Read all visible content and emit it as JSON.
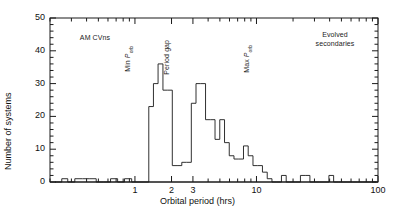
{
  "chart_data": {
    "type": "bar",
    "title": "",
    "subtitle": "",
    "xlabel": "Orbital period (hrs)",
    "ylabel": "Number of systems",
    "xscale": "log",
    "yscale": "linear",
    "xlim": [
      0.2,
      100
    ],
    "ylim": [
      0,
      50
    ],
    "grid": false,
    "legend_position": "none",
    "xticks": [
      1,
      2,
      3,
      10,
      100
    ],
    "xtick_labels": [
      "1",
      "2",
      "3",
      "10",
      "100"
    ],
    "yticks": [
      0,
      10,
      20,
      30,
      40,
      50
    ],
    "ytick_labels": [
      "0",
      "10",
      "20",
      "30",
      "40",
      "50"
    ],
    "bin_edges_log_per_decade": 18,
    "bins": [
      {
        "lo": 0.22,
        "hi": 0.25,
        "value": 0
      },
      {
        "lo": 0.25,
        "hi": 0.28,
        "value": 1
      },
      {
        "lo": 0.28,
        "hi": 0.32,
        "value": 0
      },
      {
        "lo": 0.32,
        "hi": 0.37,
        "value": 1
      },
      {
        "lo": 0.37,
        "hi": 0.42,
        "value": 1
      },
      {
        "lo": 0.42,
        "hi": 0.48,
        "value": 1
      },
      {
        "lo": 0.48,
        "hi": 0.55,
        "value": 0
      },
      {
        "lo": 0.55,
        "hi": 0.63,
        "value": 0
      },
      {
        "lo": 0.63,
        "hi": 0.72,
        "value": 1
      },
      {
        "lo": 0.72,
        "hi": 0.82,
        "value": 0
      },
      {
        "lo": 0.82,
        "hi": 0.94,
        "value": 1
      },
      {
        "lo": 0.94,
        "hi": 1.08,
        "value": 0
      },
      {
        "lo": 1.08,
        "hi": 1.23,
        "value": 0
      },
      {
        "lo": 1.23,
        "hi": 1.3,
        "value": 0
      },
      {
        "lo": 1.3,
        "hi": 1.42,
        "value": 23
      },
      {
        "lo": 1.42,
        "hi": 1.55,
        "value": 30
      },
      {
        "lo": 1.55,
        "hi": 1.7,
        "value": 36
      },
      {
        "lo": 1.7,
        "hi": 1.86,
        "value": 28
      },
      {
        "lo": 1.86,
        "hi": 2.03,
        "value": 28
      },
      {
        "lo": 2.03,
        "hi": 2.22,
        "value": 5
      },
      {
        "lo": 2.22,
        "hi": 2.43,
        "value": 5
      },
      {
        "lo": 2.43,
        "hi": 2.66,
        "value": 6
      },
      {
        "lo": 2.66,
        "hi": 2.91,
        "value": 6
      },
      {
        "lo": 2.91,
        "hi": 3.18,
        "value": 24
      },
      {
        "lo": 3.18,
        "hi": 3.48,
        "value": 30
      },
      {
        "lo": 3.48,
        "hi": 3.81,
        "value": 30
      },
      {
        "lo": 3.81,
        "hi": 4.17,
        "value": 19
      },
      {
        "lo": 4.17,
        "hi": 4.56,
        "value": 19
      },
      {
        "lo": 4.56,
        "hi": 4.99,
        "value": 13
      },
      {
        "lo": 4.99,
        "hi": 5.46,
        "value": 19
      },
      {
        "lo": 5.46,
        "hi": 5.97,
        "value": 12
      },
      {
        "lo": 5.97,
        "hi": 6.53,
        "value": 8
      },
      {
        "lo": 6.53,
        "hi": 7.15,
        "value": 7
      },
      {
        "lo": 7.15,
        "hi": 7.82,
        "value": 7
      },
      {
        "lo": 7.82,
        "hi": 8.55,
        "value": 11
      },
      {
        "lo": 8.55,
        "hi": 9.36,
        "value": 8
      },
      {
        "lo": 9.36,
        "hi": 10.24,
        "value": 5
      },
      {
        "lo": 10.24,
        "hi": 11.2,
        "value": 5
      },
      {
        "lo": 11.2,
        "hi": 12.26,
        "value": 3
      },
      {
        "lo": 12.26,
        "hi": 13.41,
        "value": 1
      },
      {
        "lo": 13.41,
        "hi": 14.67,
        "value": 0
      },
      {
        "lo": 14.67,
        "hi": 16.05,
        "value": 0
      },
      {
        "lo": 16.05,
        "hi": 17.56,
        "value": 2
      },
      {
        "lo": 17.56,
        "hi": 19.22,
        "value": 0
      },
      {
        "lo": 19.22,
        "hi": 21.03,
        "value": 0
      },
      {
        "lo": 21.03,
        "hi": 23.0,
        "value": 0
      },
      {
        "lo": 23.0,
        "hi": 25.16,
        "value": 2
      },
      {
        "lo": 25.16,
        "hi": 27.53,
        "value": 2
      },
      {
        "lo": 27.53,
        "hi": 30.12,
        "value": 0
      },
      {
        "lo": 30.12,
        "hi": 32.95,
        "value": 0
      },
      {
        "lo": 32.95,
        "hi": 36.05,
        "value": 0
      },
      {
        "lo": 36.05,
        "hi": 39.44,
        "value": 0
      },
      {
        "lo": 39.44,
        "hi": 43.15,
        "value": 2
      },
      {
        "lo": 43.15,
        "hi": 47.21,
        "value": 0
      },
      {
        "lo": 47.21,
        "hi": 51.65,
        "value": 0
      },
      {
        "lo": 51.65,
        "hi": 56.51,
        "value": 0
      },
      {
        "lo": 56.51,
        "hi": 61.82,
        "value": 0
      },
      {
        "lo": 61.82,
        "hi": 67.64,
        "value": 0
      },
      {
        "lo": 67.64,
        "hi": 74.0,
        "value": 0
      },
      {
        "lo": 74.0,
        "hi": 80.96,
        "value": 0
      },
      {
        "lo": 80.96,
        "hi": 88.58,
        "value": 0
      },
      {
        "lo": 88.58,
        "hi": 96.91,
        "value": 0
      }
    ],
    "annotations": [
      {
        "name": "am-cvns",
        "text": "AM CVns",
        "orientation": "horizontal",
        "x": 0.55,
        "y": 42
      },
      {
        "name": "min-porb",
        "text": "Min Porb",
        "orientation": "vertical",
        "x": 1.3,
        "y": 50
      },
      {
        "name": "period-gap",
        "text": "Period gap",
        "orientation": "vertical",
        "x": 2.15,
        "y": 50
      },
      {
        "name": "max-porb",
        "text": "Max Porb",
        "orientation": "vertical",
        "x": 9.2,
        "y": 50
      },
      {
        "name": "evolved-secondaries",
        "text": "Evolved secondaries",
        "orientation": "horizontal",
        "x": 40,
        "y": 43
      }
    ],
    "annotation_labels": {
      "am_cvns": "AM CVns",
      "min_porb_prefix": "Min ",
      "min_porb_var": "P",
      "min_porb_sub": "orb",
      "period_gap": "Period gap",
      "max_porb_prefix": "Max ",
      "max_porb_var": "P",
      "max_porb_sub": "orb",
      "evolved_line1": "Evolved",
      "evolved_line2": "secondaries"
    },
    "colors": {
      "line": "#1a1a1a",
      "axis": "#1a1a1a",
      "background": "#ffffff"
    }
  }
}
